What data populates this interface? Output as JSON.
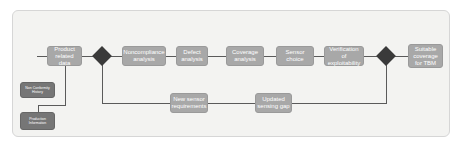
{
  "diagram": {
    "nodes": {
      "product_related_data": "Product related data",
      "noncompliance_analysis": "Noncompliance analysis",
      "defect_analysis": "Defect analysis",
      "coverage_analysis": "Coverage analysis",
      "sensor_choice": "Sensor choice",
      "verification_of_exploitability": "Verification of exploitability",
      "suitable_coverage_for_tbm": "Suitable coverage for TBM",
      "new_sensor_requirements": "New sensor requirements",
      "updated_sensing_gap": "Updated sensing gap",
      "non_conformity_history": "Non Conformity History",
      "production_information": "Production Information"
    },
    "colors": {
      "process_box": "#a8a8a8",
      "source_box": "#767676",
      "decision": "#3a3a3a",
      "connector": "#5a5a5a",
      "background": "#f3f3f1"
    }
  }
}
